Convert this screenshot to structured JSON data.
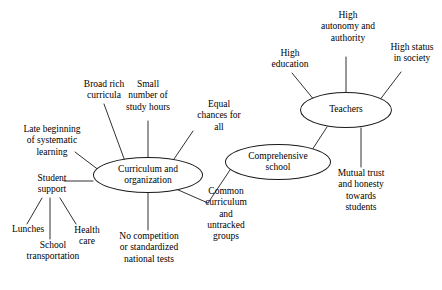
{
  "diagram": {
    "type": "concept-map",
    "title": "",
    "nodes": {
      "curriculum": {
        "label": "Curriculum and\norganization",
        "shape": "ellipse"
      },
      "comprehensive_school": {
        "label": "Comprehensive\nschool",
        "shape": "ellipse"
      },
      "teachers": {
        "label": "Teachers",
        "shape": "ellipse"
      }
    },
    "leaves": {
      "broad_rich_curricula": "Broad rich\ncurricula",
      "small_number_of_study_hours": "Small\nnumber of\nstudy hours",
      "equal_chances_for_all": "Equal\nchances for\nall",
      "late_beginning_of_systematic_learning": "Late beginning\nof systematic\nlearning",
      "student_support": "Student\nsupport",
      "lunches": "Lunches",
      "school_transportation": "School\ntransportation",
      "health_care": "Health\ncare",
      "no_competition_or_standardized_national_tests": "No competition\nor standardized\nnational tests",
      "common_curriculum_and_untracked_groups": "Common\ncurriculum\nand\nuntracked\ngroups",
      "high_education": "High\neducation",
      "high_autonomy_and_authority": "High\nautonomy and\nauthority",
      "high_status_in_society": "High status\nin society",
      "mutual_trust_and_honesty_towards_students": "Mutual trust\nand honesty\ntowards\nstudents"
    },
    "colors": {
      "stroke": "#1a1a1a",
      "text": "#000000",
      "background": "#ffffff"
    }
  }
}
